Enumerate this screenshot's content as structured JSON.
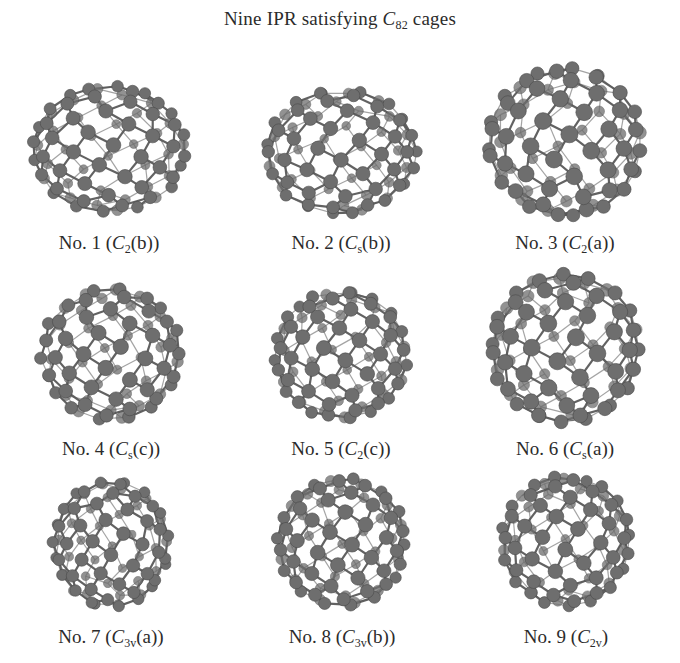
{
  "figure": {
    "title": {
      "prefix": "Nine IPR satisfying ",
      "molecule_symbol": "C",
      "molecule_subscript": "82",
      "suffix": " cages"
    },
    "colors": {
      "atom_fill": "#6e6e6e",
      "atom_edge": "#4a4a4a",
      "bond": "#5a5a5a",
      "text": "#2b2b2b",
      "background": "#ffffff"
    },
    "panels": [
      {
        "number": "1",
        "prefix": "No. 1 (",
        "sym": "C",
        "sub": "2",
        "suffix": "(b))",
        "cx": 109,
        "cy": 149,
        "rx": 83,
        "ry": 69,
        "label_y": 232,
        "seed": 11
      },
      {
        "number": "2",
        "prefix": "No. 2 (",
        "sym": "C",
        "sub": "s",
        "suffix": "(b))",
        "cx": 341,
        "cy": 152,
        "rx": 81,
        "ry": 68,
        "label_y": 232,
        "seed": 23
      },
      {
        "number": "3",
        "prefix": "No. 3 (",
        "sym": "C",
        "sub": "2",
        "suffix": "(a))",
        "cx": 565,
        "cy": 142,
        "rx": 82,
        "ry": 80,
        "label_y": 232,
        "seed": 37
      },
      {
        "number": "4",
        "prefix": "No. 4 (",
        "sym": "C",
        "sub": "s",
        "suffix": "(c))",
        "cx": 111,
        "cy": 354,
        "rx": 75,
        "ry": 72,
        "label_y": 438,
        "seed": 41
      },
      {
        "number": "5",
        "prefix": "No. 5 (",
        "sym": "C",
        "sub": "2",
        "suffix": "(c))",
        "cx": 341,
        "cy": 355,
        "rx": 73,
        "ry": 70,
        "label_y": 438,
        "seed": 53
      },
      {
        "number": "6",
        "prefix": "No. 6 (",
        "sym": "C",
        "sub": "s",
        "suffix": "(a))",
        "cx": 565,
        "cy": 348,
        "rx": 81,
        "ry": 80,
        "label_y": 438,
        "seed": 67
      },
      {
        "number": "7",
        "prefix": "No. 7 (",
        "sym": "C",
        "sub": "3v",
        "suffix": "(a))",
        "cx": 111,
        "cy": 544,
        "rx": 64,
        "ry": 69,
        "label_y": 626,
        "seed": 71
      },
      {
        "number": "8",
        "prefix": "No. 8 (",
        "sym": "C",
        "sub": "3v",
        "suffix": "(b))",
        "cx": 342,
        "cy": 542,
        "rx": 70,
        "ry": 70,
        "label_y": 626,
        "seed": 83
      },
      {
        "number": "9",
        "prefix": "No. 9 (",
        "sym": "C",
        "sub": "2v",
        "suffix": ")",
        "cx": 566,
        "cy": 541,
        "rx": 70,
        "ry": 71,
        "label_y": 626,
        "seed": 97
      }
    ]
  }
}
